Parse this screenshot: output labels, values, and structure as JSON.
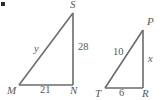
{
  "figure": {
    "background_color": "#ffffff",
    "stroke_color": "#6b6b6d",
    "text_color": "#58585a",
    "corner_mark": "bullet-square-mark",
    "triangles": [
      {
        "name": "triangle-MNS",
        "vertices": [
          {
            "key": "M",
            "label": "M",
            "x": 19,
            "y": 85
          },
          {
            "key": "N",
            "label": "N",
            "x": 73,
            "y": 85
          },
          {
            "key": "S",
            "label": "S",
            "x": 73,
            "y": 13
          }
        ],
        "sides": [
          {
            "name": "base-MN",
            "label": "21",
            "kind": "measure"
          },
          {
            "name": "leg-NS",
            "label": "28",
            "kind": "measure"
          },
          {
            "name": "hypotenuse-MS",
            "label": "y",
            "kind": "variable"
          }
        ]
      },
      {
        "name": "triangle-TRP",
        "vertices": [
          {
            "key": "T",
            "label": "T",
            "x": 105,
            "y": 88
          },
          {
            "key": "R",
            "label": "R",
            "x": 143,
            "y": 88
          },
          {
            "key": "P",
            "label": "P",
            "x": 143,
            "y": 30
          }
        ],
        "sides": [
          {
            "name": "base-TR",
            "label": "6",
            "kind": "measure"
          },
          {
            "name": "leg-RP",
            "label": "x",
            "kind": "variable"
          },
          {
            "name": "hypotenuse-TP",
            "label": "10",
            "kind": "measure"
          }
        ]
      }
    ],
    "labels": {
      "left_vertex_M": "M",
      "left_vertex_N": "N",
      "left_vertex_S": "S",
      "left_base": "21",
      "left_leg": "28",
      "left_hypotenuse": "y",
      "right_vertex_T": "T",
      "right_vertex_R": "R",
      "right_vertex_P": "P",
      "right_base": "6",
      "right_leg": "x",
      "right_hypotenuse": "10"
    }
  }
}
